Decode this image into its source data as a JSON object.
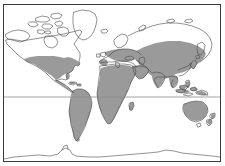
{
  "figure": {
    "type": "world-distribution-map",
    "title": "World map with shaded distribution range",
    "projection": "equirectangular",
    "frame": {
      "border_color": "#3a3a3a",
      "background_color": "#ffffff",
      "x": 3,
      "y": 4,
      "width": 218,
      "height": 158
    },
    "colors": {
      "shaded_range": "#9a9a9a",
      "coastline": "#4a4a4a",
      "unshaded_land": "#ffffff",
      "graticule": "#8c8c8c",
      "ocean": "#ffffff",
      "frame": "#3a3a3a"
    },
    "graticule": {
      "lines": [
        {
          "name": "equator",
          "type": "latitude",
          "value_deg": 0,
          "y_px": 97
        }
      ]
    },
    "legend": {
      "visible": false,
      "shaded_meaning": "distribution range present",
      "unshaded_meaning": "absent"
    },
    "regions_shaded": [
      "Contiguous United States",
      "Mexico",
      "Central America",
      "Caribbean",
      "South America",
      "Europe",
      "Africa",
      "Middle East",
      "South Asia",
      "Southeast Asia",
      "Southern and Central Asia",
      "Japan",
      "Indonesia",
      "Australia",
      "New Zealand"
    ],
    "regions_unshaded": [
      "Canada",
      "Alaska",
      "Greenland",
      "Iceland",
      "Northern Siberia",
      "Scandinavia north",
      "Antarctica",
      "Southern tip of South America"
    ]
  }
}
